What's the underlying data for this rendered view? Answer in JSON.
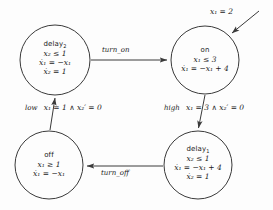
{
  "diagram": {
    "type": "state-machine",
    "background_color": "#fdfdfd",
    "line_color": "#3a3a3a",
    "text_color": "#1a1a1a",
    "states": [
      {
        "id": "delay2",
        "name": "delay",
        "name_sub": "2",
        "invariant": "x₂ ≤ 1",
        "flow_1": "ẋ₁ = −x₁",
        "flow_2": "ẋ₂ = 1",
        "cx": 55,
        "cy": 60,
        "r": 35
      },
      {
        "id": "on",
        "name": "on",
        "name_sub": "",
        "invariant": "x₁ ≤ 3",
        "flow_1": "ẋ₁ = −x₁ + 4",
        "flow_2": "",
        "cx": 205,
        "cy": 60,
        "r": 34
      },
      {
        "id": "off",
        "name": "off",
        "name_sub": "",
        "invariant": "x₁ ≥ 1",
        "flow_1": "ẋ₁ = −x₁",
        "flow_2": "",
        "cx": 49,
        "cy": 165,
        "r": 34
      },
      {
        "id": "delay1",
        "name": "delay",
        "name_sub": "1",
        "invariant": "x₂ ≤ 1",
        "flow_1": "ẋ₁ = −x₁ + 4",
        "flow_2": "ẋ₂ = 1",
        "cx": 198,
        "cy": 165,
        "r": 34
      }
    ],
    "transitions": [
      {
        "id": "delay2-to-on",
        "from": "delay2",
        "to": "on",
        "event": "turn_on",
        "guard": ""
      },
      {
        "id": "on-to-delay1",
        "from": "on",
        "to": "delay1",
        "event": "high",
        "guard": "x₁ = 3 ∧ x₂′ = 0"
      },
      {
        "id": "delay1-to-off",
        "from": "delay1",
        "to": "off",
        "event": "turn_off",
        "guard": ""
      },
      {
        "id": "off-to-delay2",
        "from": "off",
        "to": "delay2",
        "event": "low",
        "guard": "x₁ = 1 ∧ x₂′ = 0"
      }
    ],
    "initial": {
      "id": "initial-arrow",
      "target": "on",
      "condition": "x₁ = 2"
    }
  }
}
